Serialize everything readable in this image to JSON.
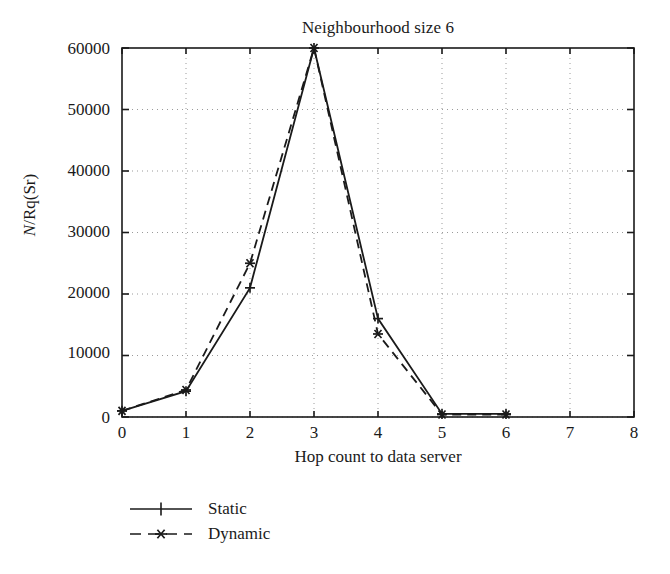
{
  "chart_data": {
    "type": "line",
    "title": "Neighbourhood size 6",
    "xlabel": "Hop count to data server",
    "ylabel": "N/Rq(Sr)",
    "ylabel_parts": {
      "italic": "N",
      "rest": "/Rq(Sr)"
    },
    "x": [
      0,
      1,
      2,
      3,
      4,
      5,
      6
    ],
    "xlim": [
      0,
      8
    ],
    "ylim": [
      0,
      60000
    ],
    "xticks": [
      "0",
      "1",
      "2",
      "3",
      "4",
      "5",
      "6",
      "7",
      "8"
    ],
    "yticks": [
      "0",
      "10000",
      "20000",
      "30000",
      "40000",
      "50000",
      "60000"
    ],
    "xtick_values": [
      0,
      1,
      2,
      3,
      4,
      5,
      6,
      7,
      8
    ],
    "ytick_values": [
      0,
      10000,
      20000,
      30000,
      40000,
      50000,
      60000
    ],
    "grid": true,
    "grid_style": "dotted",
    "legend_position": "below-left",
    "series": [
      {
        "name": "Static",
        "values": [
          1000,
          4200,
          21000,
          60000,
          16000,
          500,
          500
        ],
        "linestyle": "solid",
        "marker": "plus",
        "color": "#1a1a1a"
      },
      {
        "name": "Dynamic",
        "values": [
          1000,
          4400,
          25000,
          60000,
          13500,
          400,
          400
        ],
        "linestyle": "dashed",
        "marker": "asterisk",
        "color": "#1a1a1a"
      }
    ]
  },
  "legend": {
    "items": [
      {
        "label": "Static",
        "style": "solid-plus"
      },
      {
        "label": "Dynamic",
        "style": "dashed-asterisk"
      }
    ]
  },
  "colors": {
    "axis": "#1a1a1a",
    "grid": "#9a9a9a",
    "series": "#1a1a1a",
    "background": "#ffffff"
  }
}
